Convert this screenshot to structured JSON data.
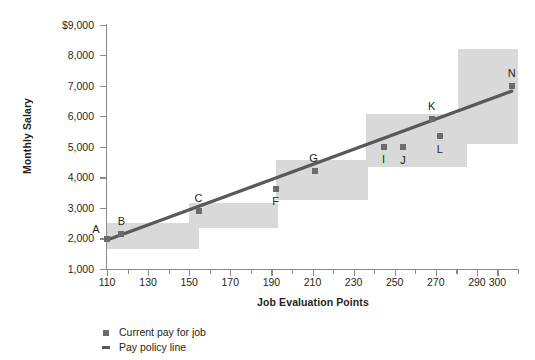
{
  "chart_data": {
    "type": "scatter",
    "title": "",
    "xlabel": "Job Evaluation Points",
    "ylabel": "Monthly Salary",
    "xlim": [
      110,
      310
    ],
    "ylim": [
      1000,
      9000
    ],
    "grid": false,
    "legend_position": "bottom-left",
    "y_ticks": [
      {
        "value": 9000,
        "label": "$9,000"
      },
      {
        "value": 8000,
        "label": "8,000"
      },
      {
        "value": 7000,
        "label": "7,000"
      },
      {
        "value": 6000,
        "label": "6,000"
      },
      {
        "value": 5000,
        "label": "5,000"
      },
      {
        "value": 4000,
        "label": "4,000"
      },
      {
        "value": 3000,
        "label": "3,000"
      },
      {
        "value": 2000,
        "label": "2,000"
      },
      {
        "value": 1000,
        "label": "1,000"
      }
    ],
    "x_ticks_major": [
      110,
      130,
      150,
      170,
      190,
      210,
      230,
      250,
      270,
      290,
      300
    ],
    "x_ticks_minor": [
      120,
      140,
      160,
      180,
      200,
      220,
      240,
      260,
      280,
      310
    ],
    "series": [
      {
        "name": "Current pay for job",
        "type": "scatter",
        "marker": "square",
        "color": "#6b6b6b",
        "points": [
          {
            "label": "A",
            "x": 110,
            "y": 1980,
            "label_dx": -11,
            "label_dy": -10
          },
          {
            "label": "B",
            "x": 117,
            "y": 2130,
            "label_dx": 0,
            "label_dy": -13
          },
          {
            "label": "C",
            "x": 155,
            "y": 2900,
            "label_dx": -1,
            "label_dy": -13
          },
          {
            "label": "F",
            "x": 192,
            "y": 3620,
            "label_dx": 0,
            "label_dy": 12
          },
          {
            "label": "G",
            "x": 211,
            "y": 4200,
            "label_dx": -1,
            "label_dy": -13
          },
          {
            "label": "I",
            "x": 245,
            "y": 5000,
            "label_dx": -1,
            "label_dy": 12
          },
          {
            "label": "J",
            "x": 254,
            "y": 5000,
            "label_dx": 0,
            "label_dy": 13
          },
          {
            "label": "K",
            "x": 268,
            "y": 5900,
            "label_dx": 0,
            "label_dy": -13
          },
          {
            "label": "L",
            "x": 272,
            "y": 5350,
            "label_dx": 0,
            "label_dy": 13
          },
          {
            "label": "N",
            "x": 307,
            "y": 6980,
            "label_dx": 0,
            "label_dy": -13
          }
        ]
      },
      {
        "name": "Pay policy line",
        "type": "line",
        "color": "#595959",
        "x_start": 110,
        "y_start": 1950,
        "x_end": 307,
        "y_end": 6820
      }
    ],
    "bands": {
      "name": "grade-ranges",
      "color": "#d9d9d9",
      "ranges": [
        {
          "grade": 1,
          "x_from": 110,
          "x_to": 155,
          "y_from": 1650,
          "y_to": 2500
        },
        {
          "grade": 2,
          "x_from": 150,
          "x_to": 193,
          "y_from": 2330,
          "y_to": 3150
        },
        {
          "grade": 3,
          "x_from": 192,
          "x_to": 237,
          "y_from": 3260,
          "y_to": 4580
        },
        {
          "grade": 4,
          "x_from": 236,
          "x_to": 285,
          "y_from": 4350,
          "y_to": 6080
        },
        {
          "grade": 5,
          "x_from": 283,
          "x_to": 310,
          "y_from": 5100,
          "y_to": 6080
        },
        {
          "grade": 6,
          "x_from": 281,
          "x_to": 310,
          "y_from": 5760,
          "y_to": 8200
        }
      ]
    },
    "legend": [
      {
        "marker": "square",
        "label": "Current pay for job"
      },
      {
        "marker": "dash",
        "label": "Pay policy line"
      }
    ]
  }
}
